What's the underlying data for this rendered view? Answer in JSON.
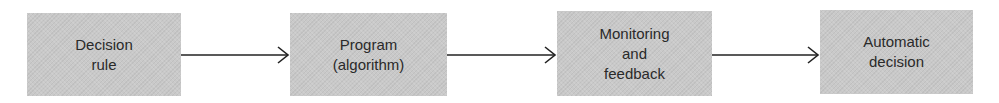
{
  "diagram": {
    "type": "flowchart",
    "direction": "left-to-right",
    "colors": {
      "box_fill": "#c9c9c9",
      "text": "#2a2a2a",
      "arrow": "#222222",
      "background": "#ffffff"
    },
    "nodes": [
      {
        "id": "decision-rule",
        "label": "Decision\nrule"
      },
      {
        "id": "program",
        "label": "Program\n(algorithm)"
      },
      {
        "id": "monitoring",
        "label": "Monitoring\nand\nfeedback"
      },
      {
        "id": "automatic-decision",
        "label": "Automatic\ndecision"
      }
    ],
    "edges": [
      {
        "from": "decision-rule",
        "to": "program"
      },
      {
        "from": "program",
        "to": "monitoring"
      },
      {
        "from": "monitoring",
        "to": "automatic-decision"
      }
    ]
  }
}
